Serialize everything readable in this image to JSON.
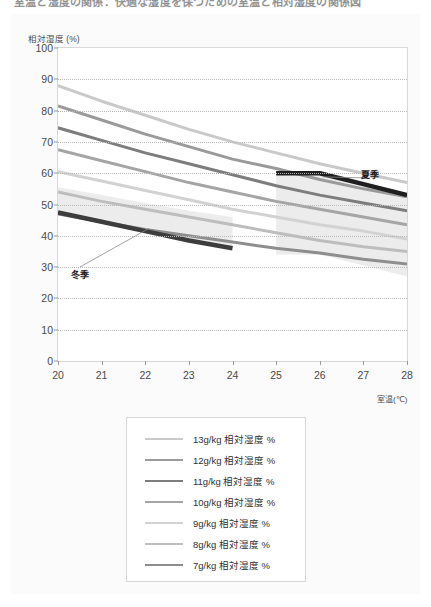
{
  "page": {
    "clipped_heading": "室温と湿度の関係：快適な湿度を保つための室温と相対湿度の関係図"
  },
  "chart_data": {
    "type": "line",
    "title": "",
    "xlabel": "室温(℃)",
    "ylabel": "相対湿度 (%)",
    "xlim": [
      20,
      28
    ],
    "ylim": [
      0,
      100
    ],
    "grid": true,
    "legend_position": "below",
    "x": [
      20,
      21,
      22,
      23,
      24,
      25,
      26,
      27,
      28
    ],
    "xticks": [
      "20",
      "21",
      "22",
      "23",
      "24",
      "25",
      "26",
      "27",
      "28"
    ],
    "yticks": [
      "0",
      "10",
      "20",
      "30",
      "40",
      "50",
      "60",
      "70",
      "80",
      "90",
      "100"
    ],
    "series": [
      {
        "name": "13g/kg 相対湿度 %",
        "color": "#c9c9c9",
        "width": 3.0,
        "values": [
          88.0,
          83.0,
          78.5,
          74.0,
          70.0,
          66.5,
          63.0,
          60.0,
          57.0
        ]
      },
      {
        "name": "12g/kg 相対湿度 %",
        "color": "#9a9a9a",
        "width": 3.0,
        "values": [
          81.5,
          77.0,
          72.5,
          68.5,
          64.5,
          61.5,
          58.0,
          55.0,
          52.5
        ]
      },
      {
        "name": "11g/kg 相対湿度 %",
        "color": "#7d7d7d",
        "width": 3.0,
        "values": [
          74.5,
          70.5,
          66.5,
          63.0,
          59.5,
          56.0,
          53.0,
          50.5,
          48.0
        ]
      },
      {
        "name": "10g/kg 相対湿度 %",
        "color": "#a5a5a5",
        "width": 3.0,
        "values": [
          67.5,
          64.0,
          60.5,
          57.0,
          54.0,
          51.0,
          48.5,
          46.0,
          43.5
        ]
      },
      {
        "name": "9g/kg 相対湿度 %",
        "color": "#d2d2d2",
        "width": 3.0,
        "values": [
          60.5,
          57.5,
          54.5,
          51.5,
          48.5,
          46.0,
          43.5,
          41.5,
          39.0
        ]
      },
      {
        "name": "8g/kg 相対湿度 %",
        "color": "#bdbdbd",
        "width": 3.0,
        "values": [
          54.0,
          51.0,
          48.5,
          46.0,
          43.5,
          41.0,
          38.5,
          36.5,
          35.0
        ]
      },
      {
        "name": "7g/kg 相対湿度 %",
        "color": "#8e8e8e",
        "width": 3.0,
        "values": [
          47.0,
          44.5,
          42.0,
          40.0,
          38.0,
          36.0,
          34.5,
          32.5,
          31.0
        ]
      }
    ],
    "annotations": [
      {
        "label": "冬季",
        "x_range": [
          20,
          24
        ],
        "y_values": [
          47.5,
          44.5,
          41.5,
          38.5,
          36.0
        ],
        "band_top": [
          55.5,
          53.0,
          50.5,
          48.0,
          46.0
        ],
        "band_color": "#e9e9e9",
        "line_color": "#3d3d3d",
        "line_width": 4.5
      },
      {
        "label": "夏季",
        "x_range": [
          25,
          28
        ],
        "y_values": [
          60.0,
          60.0,
          56.5,
          53.0
        ],
        "band_top": [
          60.0,
          60.0,
          56.5,
          53.0
        ],
        "band_color": "#e9e9e9",
        "line_color": "#1f1f1f",
        "line_width": 4.5
      }
    ]
  }
}
